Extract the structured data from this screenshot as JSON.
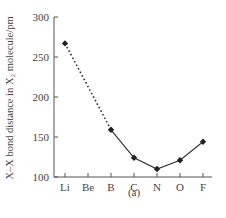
{
  "chart_data": {
    "type": "line",
    "title": "",
    "caption": "(a)",
    "xlabel": "",
    "ylabel": "X–X bond distance in X₂ molecule/pm",
    "categories": [
      "Li",
      "Be",
      "B",
      "C",
      "N",
      "O",
      "F"
    ],
    "ylim": [
      100,
      300
    ],
    "yticks": [
      100,
      150,
      200,
      250,
      300
    ],
    "grid": false,
    "legend": null,
    "series": [
      {
        "name": "X2 bond distance",
        "points": [
          {
            "x": "Li",
            "y": 267
          },
          {
            "x": "B",
            "y": 159
          },
          {
            "x": "C",
            "y": 124
          },
          {
            "x": "N",
            "y": 110
          },
          {
            "x": "O",
            "y": 121
          },
          {
            "x": "F",
            "y": 144
          }
        ],
        "segments": [
          {
            "from": "Li",
            "to": "B",
            "style": "dotted"
          },
          {
            "from": "B",
            "to": "F",
            "style": "solid"
          }
        ]
      }
    ]
  }
}
